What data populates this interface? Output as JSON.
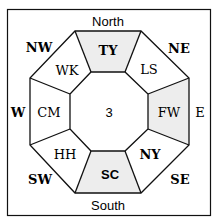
{
  "diagram": {
    "directions": {
      "north": "North",
      "south": "South",
      "east": "E",
      "west": "W",
      "northeast": "NE",
      "northwest": "NW",
      "southeast": "SE",
      "southwest": "SW"
    },
    "center": "3",
    "sectors": {
      "north": "TY",
      "northeast": "LS",
      "east": "FW",
      "southeast": "NY",
      "south": "SC",
      "southwest": "HH",
      "west": "CM",
      "northwest": "WK"
    },
    "colors": {
      "shaded": "#ededed",
      "line": "#111111",
      "background": "#ffffff"
    }
  }
}
